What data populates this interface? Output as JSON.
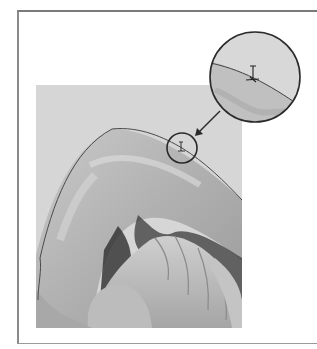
{
  "figure": {
    "colors": {
      "frame": "#7a7a7a",
      "photo_background": "#d6d6d6",
      "path_stroke": "#4a4a4a",
      "callout_stroke": "#2a2a2a"
    },
    "photo": {
      "x": 36,
      "y": 85,
      "width": 206,
      "height": 243
    },
    "small_circle": {
      "cx": 182,
      "cy": 148,
      "r": 15
    },
    "large_circle": {
      "cx": 255,
      "cy": 77,
      "r": 46
    },
    "arrow": {
      "from": [
        220,
        111
      ],
      "to": [
        196,
        135
      ]
    }
  }
}
